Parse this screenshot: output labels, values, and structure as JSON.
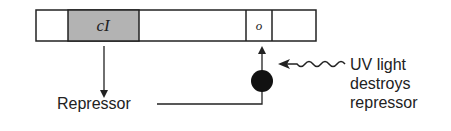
{
  "diagram": {
    "segments": [
      {
        "id": "left-blank",
        "label": ""
      },
      {
        "id": "cI",
        "label": "cI",
        "shaded": true
      },
      {
        "id": "middle-blank",
        "label": ""
      },
      {
        "id": "operator",
        "label": "o"
      },
      {
        "id": "right-blank",
        "label": ""
      }
    ],
    "product_label": "Repressor",
    "uv_label_lines": [
      "UV light",
      "destroys",
      "repressor"
    ],
    "colors": {
      "shaded": "#b3b3b3",
      "stroke": "#222222",
      "repressor_dot": "#111111"
    }
  }
}
